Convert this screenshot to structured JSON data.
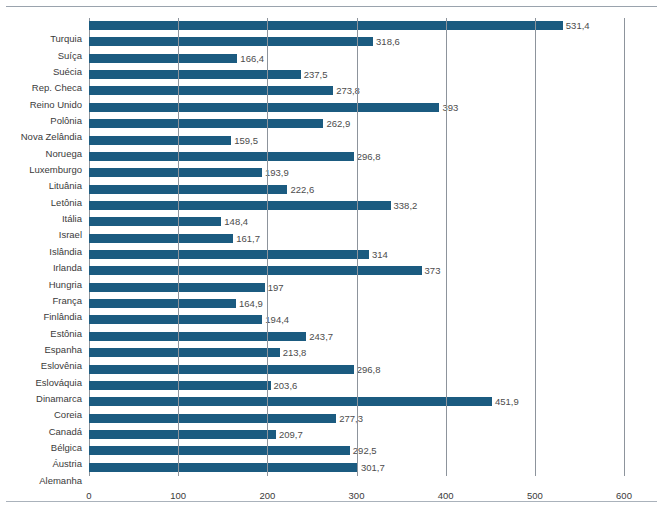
{
  "chart_data": {
    "type": "bar",
    "orientation": "horizontal",
    "title": "",
    "xlabel": "",
    "ylabel": "",
    "xlim": [
      0,
      600
    ],
    "xticks": [
      0,
      100,
      200,
      300,
      400,
      500,
      600
    ],
    "xtick_labels": [
      "0",
      "100",
      "200",
      "300",
      "400",
      "500",
      "600"
    ],
    "grid": true,
    "grid_axis": "x",
    "legend": false,
    "bar_color": "#1b5b80",
    "decimal_separator": ",",
    "categories": [
      "Turquia",
      "Suíça",
      "Suécia",
      "Rep. Checa",
      "Reino Unido",
      "Polônia",
      "Nova Zelândia",
      "Noruega",
      "Luxemburgo",
      "Lituânia",
      "Letônia",
      "Itália",
      "Israel",
      "Islândia",
      "Irlanda",
      "Hungria",
      "França",
      "Finlândia",
      "Estônia",
      "Espanha",
      "Eslovênia",
      "Eslováquia",
      "Dinamarca",
      "Coreia",
      "Canadá",
      "Bélgica",
      "Áustria",
      "Alemanha"
    ],
    "values": [
      531.4,
      318.6,
      166.4,
      237.5,
      273.8,
      393,
      262.9,
      159.5,
      296.8,
      193.9,
      222.6,
      338.2,
      148.4,
      161.7,
      314,
      373,
      197,
      164.9,
      194.4,
      243.7,
      213.8,
      296.8,
      203.6,
      451.9,
      277.3,
      209.7,
      292.5,
      301.7
    ],
    "value_labels": [
      "531,4",
      "318,6",
      "166,4",
      "237,5",
      "273,8",
      "393",
      "262,9",
      "159,5",
      "296,8",
      "193,9",
      "222,6",
      "338,2",
      "148,4",
      "161,7",
      "314",
      "373",
      "197",
      "164,9",
      "194,4",
      "243,7",
      "213,8",
      "296,8",
      "203,6",
      "451,9",
      "277,3",
      "209,7",
      "292,5",
      "301,7"
    ]
  }
}
